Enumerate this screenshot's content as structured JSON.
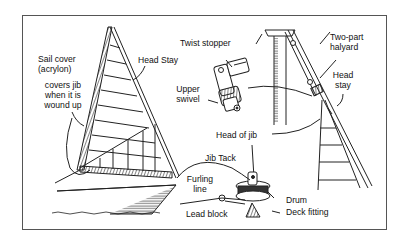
{
  "diagram": {
    "labels": {
      "sail_cover": [
        "Sail cover",
        "(acrylon)",
        "covers jib",
        "when it is",
        "wound up"
      ],
      "head_stay_left": "Head Stay",
      "twist_stopper": "Twist stopper",
      "upper_swivel": [
        "Upper",
        "swivel"
      ],
      "two_part_halyard": [
        "Two-part",
        "halyard"
      ],
      "head_stay_right": [
        "Head",
        "stay"
      ],
      "head_of_jib": "Head of jib",
      "jib_tack": "Jib Tack",
      "furling_line": [
        "Furling",
        "line"
      ],
      "drum": "Drum",
      "lead_block": "Lead block",
      "deck_fitting": "Deck fitting"
    },
    "colors": {
      "ink": "#222222",
      "frame": "#555555",
      "background": "#ffffff"
    }
  }
}
